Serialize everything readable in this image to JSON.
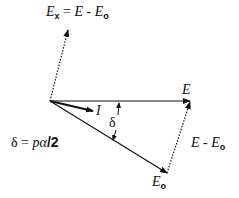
{
  "diagram": {
    "type": "phasor-diagram",
    "colors": {
      "stroke": "#111111",
      "background": "#ffffff"
    },
    "origin": [
      50,
      101
    ],
    "vectors": [
      {
        "name": "E",
        "from": [
          50,
          101
        ],
        "to": [
          190,
          101
        ],
        "style": "solid"
      },
      {
        "name": "E_o",
        "from": [
          50,
          101
        ],
        "to": [
          167,
          173
        ],
        "style": "solid"
      },
      {
        "name": "I",
        "from": [
          50,
          101
        ],
        "to": [
          93,
          111
        ],
        "style": "solid-bold"
      },
      {
        "name": "E_x",
        "from": [
          50,
          101
        ],
        "to": [
          68,
          30
        ],
        "style": "dotted"
      },
      {
        "name": "E - E_o",
        "from": [
          167,
          173
        ],
        "to": [
          190,
          101
        ],
        "style": "dotted"
      }
    ],
    "angle": {
      "name": "delta",
      "symbol": "δ"
    }
  },
  "labels": {
    "ex_eq": {
      "lhs": "E",
      "lhs_sub": "x",
      "eq": " = ",
      "rhs1": "E",
      "minus": " - ",
      "rhs2": "E",
      "rhs2_sub": "o"
    },
    "e": "E",
    "i": "I",
    "delta": "δ",
    "e_minus_eo": {
      "a": "E",
      "minus": " - ",
      "b": "E",
      "b_sub": "o"
    },
    "eo": {
      "main": "E",
      "sub": "o"
    },
    "delta_eq": {
      "sym": "δ",
      "eq": " = ",
      "expr": "pα",
      "slash": "/2"
    }
  }
}
